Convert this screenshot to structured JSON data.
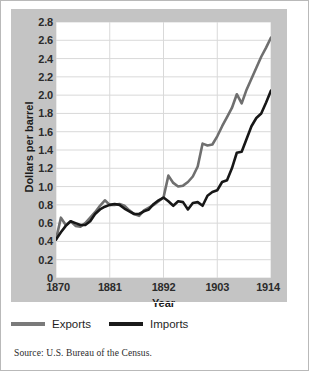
{
  "figure": {
    "y_axis_title": "Dollars per barrel",
    "x_axis_title": "Year",
    "source": "Source: U.S. Bureau of the Census."
  },
  "legend": {
    "items": [
      {
        "label": "Exports",
        "color": "#7a7a7a"
      },
      {
        "label": "Imports",
        "color": "#1a1a1a"
      }
    ]
  },
  "colors": {
    "panel_background": "#c4c4c4",
    "plot_background": "#ffffff",
    "gridline": "#d9d9d9",
    "exports_line": "#6f6f6f",
    "imports_line": "#171717",
    "text": "#1c1c1c"
  },
  "chart_data": {
    "type": "line",
    "title": "",
    "xlabel": "Year",
    "ylabel": "Dollars per barrel",
    "xlim": [
      1870,
      1914
    ],
    "ylim": [
      0,
      2.8
    ],
    "grid": true,
    "legend_position": "below",
    "ytick_labels": [
      "2.8",
      "2.6",
      "2.4",
      "2.2",
      "2.0",
      "1.8",
      "1.6",
      "1.4",
      "1.2",
      "1.0",
      "0.8",
      "0.6",
      "0.4",
      "0.2",
      "0"
    ],
    "ytick_values": [
      2.8,
      2.6,
      2.4,
      2.2,
      2.0,
      1.8,
      1.6,
      1.4,
      1.2,
      1.0,
      0.8,
      0.6,
      0.4,
      0.2,
      0
    ],
    "xtick_labels": [
      "1870",
      "1881",
      "1892",
      "1903",
      "1914"
    ],
    "xtick_values": [
      1870,
      1881,
      1892,
      1903,
      1914
    ],
    "x": [
      1870,
      1871,
      1872,
      1873,
      1874,
      1875,
      1876,
      1877,
      1878,
      1879,
      1880,
      1881,
      1882,
      1883,
      1884,
      1885,
      1886,
      1887,
      1888,
      1889,
      1890,
      1891,
      1892,
      1893,
      1894,
      1895,
      1896,
      1897,
      1898,
      1899,
      1900,
      1901,
      1902,
      1903,
      1904,
      1905,
      1906,
      1907,
      1908,
      1909,
      1910,
      1911,
      1912,
      1913,
      1914
    ],
    "series": [
      {
        "name": "Exports",
        "color": "#6f6f6f",
        "values": [
          0.42,
          0.66,
          0.58,
          0.62,
          0.57,
          0.56,
          0.6,
          0.66,
          0.72,
          0.79,
          0.85,
          0.8,
          0.8,
          0.81,
          0.79,
          0.74,
          0.7,
          0.68,
          0.74,
          0.77,
          0.8,
          0.84,
          0.88,
          1.12,
          1.04,
          1.0,
          1.01,
          1.05,
          1.11,
          1.22,
          1.47,
          1.45,
          1.46,
          1.55,
          1.66,
          1.76,
          1.86,
          2.01,
          1.91,
          2.06,
          2.18,
          2.3,
          2.42,
          2.52,
          2.63
        ]
      },
      {
        "name": "Imports",
        "color": "#171717",
        "values": [
          0.42,
          0.5,
          0.57,
          0.62,
          0.6,
          0.58,
          0.58,
          0.62,
          0.7,
          0.75,
          0.78,
          0.8,
          0.81,
          0.8,
          0.76,
          0.73,
          0.7,
          0.7,
          0.73,
          0.75,
          0.81,
          0.85,
          0.88,
          0.84,
          0.79,
          0.84,
          0.83,
          0.75,
          0.82,
          0.83,
          0.79,
          0.9,
          0.94,
          0.96,
          1.05,
          1.07,
          1.2,
          1.37,
          1.38,
          1.52,
          1.66,
          1.75,
          1.8,
          1.92,
          2.05
        ]
      }
    ]
  }
}
